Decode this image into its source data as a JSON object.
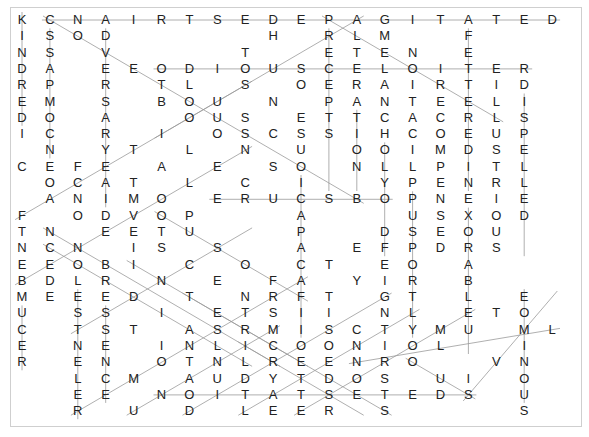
{
  "puzzle": {
    "type": "word-search",
    "columns": 20,
    "rows_count": 25,
    "grid": [
      "KCNAIRTSEDEPAGITATED",
      "ISOD     H RLM  F   ",
      "NS V    T  ETEN E   ",
      "DA EEODIOUSCELOITER ",
      "RP R TL S OERAIRTID ",
      "EM S BOU N PANTEELI ",
      "DO A  OUS ETTCACRLS ",
      "IC R I OSCSSIHCOEUP ",
      " N YT L N U OOIMDSE ",
      "CEFE A E SO NLLPITL ",
      " OCAT L C I  YPENRL ",
      " ANIMO ERUCSBOPNEIE ",
      "F ODVOP   A   USXOD ",
      "TN EETU   P  DSEOU  ",
      "NCN IS S  A EFPDRS  ",
      "EEOBI C O CT EO A   ",
      "BDLR N E FA YIR B   ",
      "MEEED T NRFT GT L E ",
      "U SS I ETSII NL ETO ",
      "C TST ASRMISCTYMU ML",
      "E NE INLICOONIOL  I ",
      "R EN OTNLREENRO  VN ",
      "  LCM AUDYTDOS UI O ",
      "  EE NOITATSETEDS U ",
      "  R U D LEER S    S "
    ],
    "line_color": "#9a9a9a",
    "letter_color": "#222222",
    "border_color": "#cfcfcf",
    "found_lines": [
      {
        "from": [
          0,
          1
        ],
        "to": [
          0,
          19
        ]
      },
      {
        "from": [
          3,
          5
        ],
        "to": [
          3,
          18
        ]
      },
      {
        "from": [
          11,
          7
        ],
        "to": [
          11,
          13
        ]
      },
      {
        "from": [
          23,
          5
        ],
        "to": [
          23,
          16
        ]
      },
      {
        "from": [
          0,
          1
        ],
        "to": [
          11,
          12
        ]
      },
      {
        "from": [
          0,
          12
        ],
        "to": [
          7,
          5
        ]
      },
      {
        "from": [
          0,
          11
        ],
        "to": [
          6,
          17
        ]
      },
      {
        "from": [
          1,
          11
        ],
        "to": [
          10,
          11
        ]
      },
      {
        "from": [
          1,
          16
        ],
        "to": [
          10,
          16
        ]
      },
      {
        "from": [
          5,
          18
        ],
        "to": [
          14,
          18
        ]
      },
      {
        "from": [
          0,
          0
        ],
        "to": [
          6,
          0
        ]
      },
      {
        "from": [
          1,
          1
        ],
        "to": [
          8,
          1
        ]
      },
      {
        "from": [
          1,
          3
        ],
        "to": [
          11,
          3
        ]
      },
      {
        "from": [
          6,
          12
        ],
        "to": [
          10,
          12
        ]
      },
      {
        "from": [
          10,
          10
        ],
        "to": [
          19,
          10
        ]
      },
      {
        "from": [
          11,
          14
        ],
        "to": [
          19,
          14
        ]
      },
      {
        "from": [
          12,
          16
        ],
        "to": [
          20,
          16
        ]
      },
      {
        "from": [
          8,
          13
        ],
        "to": [
          14,
          13
        ]
      },
      {
        "from": [
          18,
          0
        ],
        "to": [
          21,
          0
        ]
      },
      {
        "from": [
          17,
          2
        ],
        "to": [
          24,
          2
        ]
      },
      {
        "from": [
          18,
          3
        ],
        "to": [
          23,
          3
        ]
      },
      {
        "from": [
          17,
          18
        ],
        "to": [
          23,
          18
        ]
      },
      {
        "from": [
          13,
          1
        ],
        "to": [
          21,
          9
        ]
      },
      {
        "from": [
          14,
          1
        ],
        "to": [
          21,
          8
        ]
      },
      {
        "from": [
          12,
          0
        ],
        "to": [
          4,
          8
        ]
      },
      {
        "from": [
          16,
          0
        ],
        "to": [
          8,
          8
        ]
      },
      {
        "from": [
          19,
          2
        ],
        "to": [
          13,
          8
        ]
      },
      {
        "from": [
          24,
          2
        ],
        "to": [
          16,
          10
        ]
      },
      {
        "from": [
          24,
          4
        ],
        "to": [
          19,
          9
        ]
      },
      {
        "from": [
          24,
          6
        ],
        "to": [
          17,
          13
        ]
      },
      {
        "from": [
          24,
          8
        ],
        "to": [
          18,
          14
        ]
      },
      {
        "from": [
          24,
          10
        ],
        "to": [
          18,
          16
        ]
      },
      {
        "from": [
          23,
          16
        ],
        "to": [
          17,
          19
        ]
      },
      {
        "from": [
          21,
          12
        ],
        "to": [
          19,
          19
        ]
      },
      {
        "from": [
          17,
          6
        ],
        "to": [
          24,
          13
        ]
      },
      {
        "from": [
          15,
          4
        ],
        "to": [
          21,
          10
        ]
      },
      {
        "from": [
          12,
          5
        ],
        "to": [
          17,
          10
        ]
      },
      {
        "from": [
          20,
          8
        ],
        "to": [
          24,
          12
        ]
      },
      {
        "from": [
          21,
          14
        ],
        "to": [
          23,
          16
        ]
      }
    ]
  }
}
